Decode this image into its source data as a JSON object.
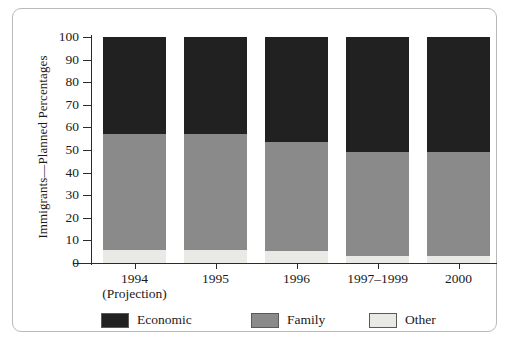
{
  "chart_data": {
    "type": "bar",
    "subtype": "stacked-bar-100-percent",
    "title": "",
    "xlabel": "",
    "ylabel": "Immigrants—Planned Percentages",
    "ylim": [
      0,
      100
    ],
    "yticks": [
      0,
      10,
      20,
      30,
      40,
      50,
      60,
      70,
      80,
      90,
      100
    ],
    "ytick_labels": [
      "0",
      "10",
      "20",
      "30",
      "40",
      "50",
      "60",
      "70",
      "80",
      "90",
      "100"
    ],
    "grid": false,
    "legend_position": "bottom",
    "categories": [
      "1994",
      "1995",
      "1996",
      "1997–1999",
      "2000"
    ],
    "category_sublabels": [
      "(Projection)",
      "",
      "",
      "",
      ""
    ],
    "stack_order_bottom_to_top": [
      "Other",
      "Family",
      "Economic"
    ],
    "series": [
      {
        "name": "Economic",
        "color": "#212121",
        "values": [
          43,
          43,
          46.5,
          51,
          51
        ]
      },
      {
        "name": "Family",
        "color": "#8a8a8a",
        "values": [
          51.3,
          51.3,
          48,
          46,
          46
        ]
      },
      {
        "name": "Other",
        "color": "#e9e9e6",
        "values": [
          5.7,
          5.7,
          5.5,
          3,
          3
        ]
      }
    ],
    "cumulative_tops": {
      "Other": [
        5.7,
        5.7,
        5.5,
        3,
        3
      ],
      "Family": [
        57,
        57,
        53.5,
        49,
        49
      ],
      "Economic": [
        100,
        100,
        100,
        100,
        100
      ]
    }
  },
  "legend": {
    "items": [
      {
        "label": "Economic",
        "color": "#212121"
      },
      {
        "label": "Family",
        "color": "#8a8a8a"
      },
      {
        "label": "Other",
        "color": "#e9e9e6"
      }
    ]
  },
  "colors": {
    "economic": "#212121",
    "family": "#8a8a8a",
    "other": "#e9e9e6",
    "axis": "#2b2b2b",
    "frame": "#b9b9b5",
    "background": "#ffffff",
    "text": "#1a1a1a"
  }
}
